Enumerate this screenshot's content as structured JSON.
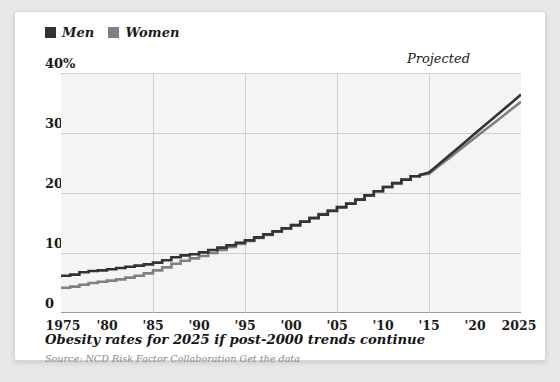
{
  "legend": {
    "items": [
      {
        "label": "Men",
        "color": "#333333",
        "icon": "square-swatch-icon"
      },
      {
        "label": "Women",
        "color": "#808080",
        "icon": "square-swatch-icon"
      }
    ]
  },
  "annotation": {
    "projected": "Projected"
  },
  "caption": {
    "title": "Obesity rates for 2025 if post-2000 trends continue",
    "source": "Source: NCD Risk Factor Collaboration Get the data"
  },
  "chart_data": {
    "type": "line",
    "title": "Obesity rates for 2025 if post-2000 trends continue",
    "xlabel": "",
    "ylabel": "",
    "xlim": [
      1975,
      2025
    ],
    "ylim": [
      0,
      40
    ],
    "yticks": [
      0,
      10,
      20,
      30,
      40
    ],
    "ytick_labels": [
      "0",
      "10",
      "20",
      "30",
      "40%"
    ],
    "xticks": [
      1975,
      1980,
      1985,
      1990,
      1995,
      2000,
      2005,
      2010,
      2015,
      2020,
      2025
    ],
    "xtick_labels": [
      "1975",
      "'80",
      "'85",
      "'90",
      "'95",
      "'00",
      "'05",
      "'10",
      "'15",
      "'20",
      "2025"
    ],
    "grid": true,
    "legend_position": "above-top-left",
    "annotations": [
      {
        "text": "Projected",
        "x": 2020,
        "y": 40,
        "note": "forecast region label, right of plot top"
      }
    ],
    "x": [
      1975,
      1976,
      1977,
      1978,
      1979,
      1980,
      1981,
      1982,
      1983,
      1984,
      1985,
      1986,
      1987,
      1988,
      1989,
      1990,
      1991,
      1992,
      1993,
      1994,
      1995,
      1996,
      1997,
      1998,
      1999,
      2000,
      2001,
      2002,
      2003,
      2004,
      2005,
      2006,
      2007,
      2008,
      2009,
      2010,
      2011,
      2012,
      2013,
      2014,
      2015,
      2016,
      2017,
      2018,
      2019,
      2020,
      2021,
      2022,
      2023,
      2024,
      2025
    ],
    "series": [
      {
        "name": "Men",
        "color": "#333333",
        "values": [
          6.2,
          6.4,
          6.8,
          7.0,
          7.1,
          7.3,
          7.5,
          7.7,
          7.9,
          8.1,
          8.4,
          8.8,
          9.3,
          9.6,
          9.8,
          10.1,
          10.5,
          10.9,
          11.3,
          11.7,
          12.1,
          12.6,
          13.1,
          13.6,
          14.1,
          14.6,
          15.2,
          15.8,
          16.4,
          17.0,
          17.6,
          18.2,
          18.9,
          19.6,
          20.3,
          21.0,
          21.6,
          22.2,
          22.8,
          23.0,
          23.4,
          24.7,
          26.0,
          27.3,
          28.6,
          29.9,
          31.2,
          32.5,
          33.8,
          35.1,
          36.4
        ],
        "projection_starts": 2014
      },
      {
        "name": "Women",
        "color": "#808080",
        "values": [
          4.2,
          4.4,
          4.7,
          5.0,
          5.2,
          5.4,
          5.6,
          5.9,
          6.2,
          6.6,
          7.1,
          7.6,
          8.2,
          8.7,
          9.1,
          9.5,
          10.0,
          10.5,
          11.0,
          11.5,
          12.0,
          12.5,
          13.0,
          13.6,
          14.1,
          14.7,
          15.3,
          15.9,
          16.5,
          17.1,
          17.7,
          18.3,
          18.9,
          19.6,
          20.3,
          21.0,
          21.7,
          22.3,
          22.8,
          23.0,
          23.2,
          24.4,
          25.6,
          26.8,
          28.0,
          29.2,
          30.4,
          31.6,
          32.8,
          34.0,
          35.2
        ],
        "projection_starts": 2014
      }
    ]
  }
}
